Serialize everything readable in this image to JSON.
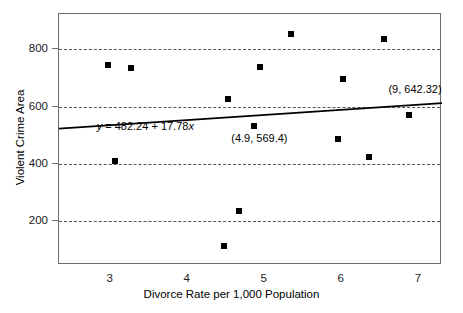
{
  "chart_data": {
    "type": "scatter",
    "title": "",
    "xlabel": "Divorce Rate per 1,000 Population",
    "ylabel": "Violent Crime Area",
    "xlim": [
      2.33,
      7.3
    ],
    "ylim": [
      48,
      923
    ],
    "xticks": [
      3,
      4,
      5,
      6,
      7
    ],
    "xtick_labels": [
      "3",
      "4",
      "5",
      "6",
      "7"
    ],
    "yticks": [
      200,
      400,
      600,
      800
    ],
    "ytick_labels": [
      "200",
      "400",
      "600",
      "800"
    ],
    "grid": "horizontal-dashed",
    "legend": "none",
    "points": [
      {
        "x": 2.97,
        "y": 745
      },
      {
        "x": 3.26,
        "y": 735
      },
      {
        "x": 3.05,
        "y": 409
      },
      {
        "x": 4.47,
        "y": 113
      },
      {
        "x": 4.52,
        "y": 627
      },
      {
        "x": 4.67,
        "y": 235
      },
      {
        "x": 4.86,
        "y": 533
      },
      {
        "x": 4.94,
        "y": 738
      },
      {
        "x": 5.34,
        "y": 855
      },
      {
        "x": 5.95,
        "y": 487
      },
      {
        "x": 6.01,
        "y": 697
      },
      {
        "x": 6.35,
        "y": 423
      },
      {
        "x": 6.55,
        "y": 836
      },
      {
        "x": 6.87,
        "y": 571
      }
    ],
    "regression": {
      "equation_label": "y = 482.24 + 17.78x",
      "equation_y_var": "y",
      "equation_rest": " = 482.24 + 17.78",
      "equation_x_var": "x",
      "intercept": 482.24,
      "slope": 17.78
    },
    "annotations": [
      {
        "name": "predicted-point-label",
        "text": "(9, 642.32)",
        "x": 6.95,
        "y": 660
      },
      {
        "name": "observed-point-label",
        "text": "(4.9, 569.4)",
        "x": 4.93,
        "y": 492
      }
    ]
  }
}
